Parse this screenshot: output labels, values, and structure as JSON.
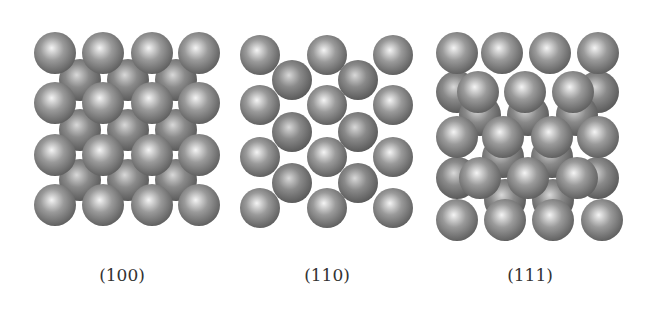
{
  "figure": {
    "panels": [
      {
        "label": "(100)",
        "label_x": 122,
        "sphere_radius": 21,
        "back_layer": [
          [
            80,
            80
          ],
          [
            128,
            80
          ],
          [
            176,
            80
          ],
          [
            80,
            130
          ],
          [
            128,
            130
          ],
          [
            176,
            130
          ],
          [
            80,
            180
          ],
          [
            128,
            180
          ],
          [
            176,
            180
          ]
        ],
        "front_layer": [
          [
            55,
            53
          ],
          [
            103,
            53
          ],
          [
            152,
            53
          ],
          [
            199,
            53
          ],
          [
            55,
            103
          ],
          [
            103,
            103
          ],
          [
            152,
            103
          ],
          [
            199,
            103
          ],
          [
            55,
            155
          ],
          [
            103,
            155
          ],
          [
            152,
            155
          ],
          [
            199,
            155
          ],
          [
            55,
            205
          ],
          [
            103,
            205
          ],
          [
            152,
            205
          ],
          [
            199,
            205
          ]
        ]
      },
      {
        "label": "(110)",
        "label_x": 327,
        "sphere_radius": 20,
        "back_layer": [
          [
            292,
            80
          ],
          [
            358,
            80
          ],
          [
            292,
            132
          ],
          [
            358,
            132
          ],
          [
            292,
            183
          ],
          [
            358,
            183
          ]
        ],
        "front_layer": [
          [
            260,
            55
          ],
          [
            327,
            55
          ],
          [
            393,
            55
          ],
          [
            260,
            105
          ],
          [
            327,
            105
          ],
          [
            393,
            105
          ],
          [
            260,
            157
          ],
          [
            327,
            157
          ],
          [
            393,
            157
          ],
          [
            260,
            208
          ],
          [
            327,
            208
          ],
          [
            393,
            208
          ]
        ]
      },
      {
        "label": "(111)",
        "label_x": 530,
        "sphere_radius": 21,
        "back_layer": [
          [
            457,
            92
          ],
          [
            598,
            92
          ],
          [
            457,
            178
          ],
          [
            598,
            178
          ],
          [
            480,
            115
          ],
          [
            528,
            115
          ],
          [
            577,
            115
          ],
          [
            503,
            157
          ],
          [
            552,
            157
          ],
          [
            505,
            200
          ],
          [
            553,
            200
          ]
        ],
        "front_layer": [
          [
            457,
            53
          ],
          [
            502,
            53
          ],
          [
            550,
            53
          ],
          [
            598,
            53
          ],
          [
            478,
            92
          ],
          [
            525,
            92
          ],
          [
            573,
            92
          ],
          [
            457,
            137
          ],
          [
            503,
            137
          ],
          [
            552,
            137
          ],
          [
            598,
            137
          ],
          [
            480,
            178
          ],
          [
            528,
            178
          ],
          [
            577,
            178
          ],
          [
            457,
            220
          ],
          [
            505,
            220
          ],
          [
            553,
            220
          ],
          [
            602,
            220
          ]
        ]
      }
    ],
    "colors": {
      "sphere_highlight": "#f4f4f4",
      "sphere_mid": "#9a9a9a",
      "sphere_shadow": "#5a5a5a",
      "back_highlight": "#d8d8d8",
      "back_mid": "#8a8a8a",
      "back_shadow": "#555555",
      "label": "#333333",
      "background": "#ffffff"
    }
  }
}
